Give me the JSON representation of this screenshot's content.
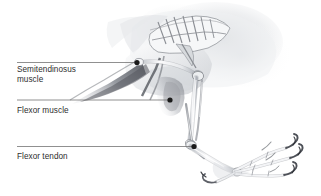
{
  "figure": {
    "background_color": "#ffffff",
    "width": 321,
    "height": 196
  },
  "style": {
    "leader_line_color": "#6b6b6b",
    "marker_color": "#1a1a1a",
    "label_text_color": "#2e2e2e",
    "bone_outline_color": "#8a8d93",
    "bone_fill_color": "#f4f5f7",
    "muscle_shadow_color": "#5c5f66",
    "body_haze_color": "#d9dbdf"
  },
  "callouts": [
    {
      "id": "semitendinosus",
      "label": "Semitendinosus\nmuscle",
      "label_x": 17,
      "label_y": 65,
      "line_x1": 17,
      "line_y1": 62.5,
      "line_x2": 136,
      "line_y2": 62.5,
      "marker_x": 137,
      "marker_y": 62.5,
      "marker_r": 2.6
    },
    {
      "id": "flexor-muscle",
      "label": "Flexor muscle",
      "label_x": 17,
      "label_y": 106,
      "line_x1": 17,
      "line_y1": 100,
      "line_x2": 169,
      "line_y2": 100,
      "marker_x": 170,
      "marker_y": 100,
      "marker_r": 2.6
    },
    {
      "id": "flexor-tendon",
      "label": "Flexor tendon",
      "label_x": 17,
      "label_y": 152,
      "line_x1": 17,
      "line_y1": 146.5,
      "line_x2": 193,
      "line_y2": 146.5,
      "marker_x": 194,
      "marker_y": 146.5,
      "marker_r": 2.6
    }
  ],
  "anatomy_parts": [
    "pelvis-vertebrae",
    "femur",
    "knee-joint",
    "tibiotarsus",
    "fibula",
    "intertarsal-joint",
    "tarsometatarsus",
    "hallux",
    "toe-digit-2",
    "toe-digit-3",
    "toe-digit-4",
    "claws",
    "semitendinosus-muscle-body",
    "flexor-muscle-body",
    "flexor-tendon-strand",
    "body-silhouette-haze"
  ]
}
